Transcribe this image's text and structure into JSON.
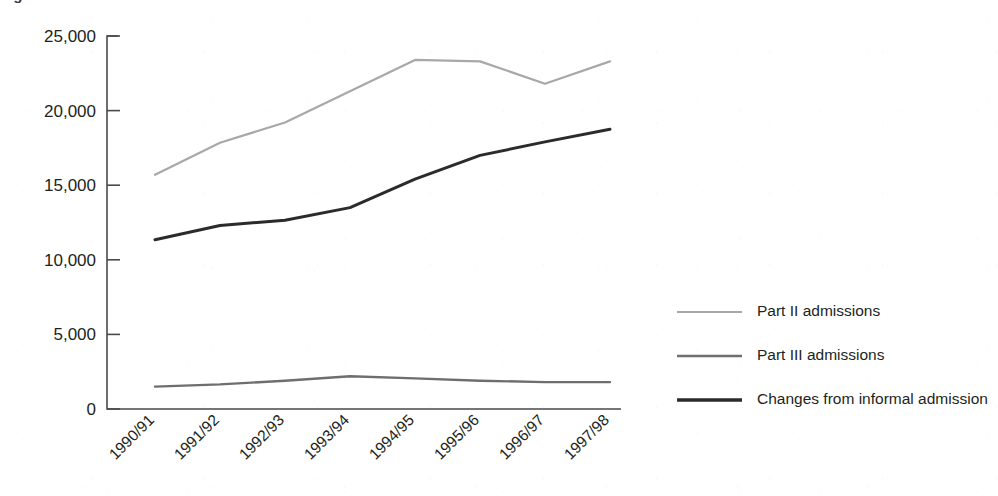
{
  "figure": {
    "title_fragment": "Figure",
    "background_color": "#ffffff"
  },
  "chart_data": {
    "type": "line",
    "title": "",
    "xlabel": "",
    "ylabel": "",
    "categories": [
      "1990/91",
      "1991/92",
      "1992/93",
      "1993/94",
      "1994/95",
      "1995/96",
      "1996/97",
      "1997/98"
    ],
    "ylim": [
      0,
      25000
    ],
    "yticks": [
      0,
      5000,
      10000,
      15000,
      20000,
      25000
    ],
    "ytick_labels": [
      "0",
      "5,000",
      "10,000",
      "15,000",
      "20,000",
      "25,000"
    ],
    "grid": false,
    "legend_position": "right",
    "series": [
      {
        "name": "Part II admissions",
        "color": "#a8a8a8",
        "line_width": 2.2,
        "values": [
          15700,
          17850,
          19200,
          21300,
          23400,
          23300,
          21800,
          23300
        ]
      },
      {
        "name": "Part III admissions",
        "color": "#6e6e6e",
        "line_width": 2.4,
        "values": [
          1500,
          1650,
          1900,
          2200,
          2050,
          1900,
          1800,
          1800
        ]
      },
      {
        "name": "Changes from informal admission",
        "color": "#2b2b2b",
        "line_width": 3.0,
        "values": [
          11350,
          12300,
          12650,
          13500,
          15400,
          17000,
          17900,
          18750
        ]
      }
    ]
  },
  "legend": {
    "items": [
      {
        "label": "Part II admissions",
        "color": "#a8a8a8",
        "line_width": 2.2
      },
      {
        "label": "Part III admissions",
        "color": "#6e6e6e",
        "line_width": 2.6
      },
      {
        "label": "Changes from informal admission",
        "color": "#2b2b2b",
        "line_width": 3.4
      }
    ]
  },
  "axis": {
    "line_color": "#4a4a4a"
  }
}
